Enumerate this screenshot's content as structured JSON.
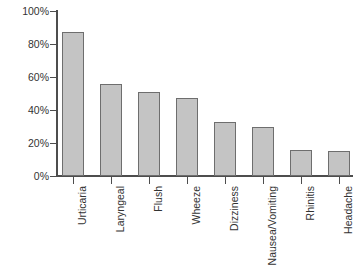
{
  "chart_data": {
    "type": "bar",
    "title": "",
    "subtitle": "",
    "xlabel": "",
    "ylabel": "",
    "categories": [
      "Urticaria",
      "Laryngeal",
      "Flush",
      "Wheeze",
      "Dizziness",
      "Nausea/Vomiting",
      "Rhinitis",
      "Headache"
    ],
    "values": [
      87,
      56,
      51,
      47,
      33,
      30,
      16,
      15
    ],
    "ylim": [
      0,
      100
    ],
    "y_ticks": [
      0,
      20,
      40,
      60,
      80,
      100
    ],
    "y_tick_labels": [
      "0%",
      "20%",
      "40%",
      "60%",
      "80%",
      "100%"
    ],
    "grid": false,
    "legend": null,
    "bar_fill_color": "#c4c4c4",
    "bar_border_color": "#6e6e6e",
    "axis_color": "#4d4d4d",
    "background_color": "#ffffff",
    "text_color": "#333333"
  }
}
